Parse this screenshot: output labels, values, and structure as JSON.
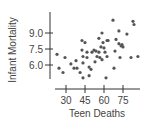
{
  "chart_data": {
    "type": "scatter",
    "title": "",
    "xlabel": "Teen Deaths",
    "ylabel": "Infant Mortality",
    "xticks": [
      30,
      45,
      60,
      75
    ],
    "xtick_labels": [
      "30",
      "45",
      "60",
      "75"
    ],
    "yticks": [
      6.0,
      7.5,
      9.0
    ],
    "ytick_labels": [
      "6.0",
      "7.5",
      "9.0"
    ],
    "xlim": [
      21,
      90
    ],
    "ylim": [
      4.5,
      11.0
    ],
    "grid": false,
    "legend": null,
    "point_color": "#555555",
    "axis_color": "#333333",
    "points": [
      {
        "x": 22.9,
        "y": 7.0
      },
      {
        "x": 24.5,
        "y": 5.7
      },
      {
        "x": 27.6,
        "y": 5.3
      },
      {
        "x": 29.2,
        "y": 6.7
      },
      {
        "x": 33.9,
        "y": 6.1
      },
      {
        "x": 36.3,
        "y": 5.7
      },
      {
        "x": 37.9,
        "y": 6.4
      },
      {
        "x": 38.7,
        "y": 5.7
      },
      {
        "x": 41.1,
        "y": 5.3
      },
      {
        "x": 42.6,
        "y": 8.3
      },
      {
        "x": 42.6,
        "y": 7.4
      },
      {
        "x": 43.4,
        "y": 6.8
      },
      {
        "x": 43.4,
        "y": 6.2
      },
      {
        "x": 43.4,
        "y": 4.8
      },
      {
        "x": 45.0,
        "y": 8.1
      },
      {
        "x": 46.6,
        "y": 7.2
      },
      {
        "x": 46.6,
        "y": 6.7
      },
      {
        "x": 48.2,
        "y": 5.0
      },
      {
        "x": 48.2,
        "y": 5.8
      },
      {
        "x": 49.7,
        "y": 5.6
      },
      {
        "x": 50.5,
        "y": 7.2
      },
      {
        "x": 52.1,
        "y": 7.4
      },
      {
        "x": 52.9,
        "y": 6.3
      },
      {
        "x": 53.7,
        "y": 7.3
      },
      {
        "x": 54.5,
        "y": 6.8
      },
      {
        "x": 56.0,
        "y": 7.2
      },
      {
        "x": 56.0,
        "y": 8.5
      },
      {
        "x": 56.8,
        "y": 6.7
      },
      {
        "x": 57.6,
        "y": 7.7
      },
      {
        "x": 58.4,
        "y": 9.0
      },
      {
        "x": 58.4,
        "y": 6.5
      },
      {
        "x": 59.2,
        "y": 8.1
      },
      {
        "x": 60.0,
        "y": 7.6
      },
      {
        "x": 60.8,
        "y": 7.2
      },
      {
        "x": 61.6,
        "y": 4.8
      },
      {
        "x": 62.4,
        "y": 6.8
      },
      {
        "x": 62.4,
        "y": 8.3
      },
      {
        "x": 63.2,
        "y": 8.3
      },
      {
        "x": 67.1,
        "y": 10.2
      },
      {
        "x": 67.9,
        "y": 5.7
      },
      {
        "x": 68.7,
        "y": 7.3
      },
      {
        "x": 69.5,
        "y": 8.4
      },
      {
        "x": 71.8,
        "y": 9.2
      },
      {
        "x": 71.8,
        "y": 8.0
      },
      {
        "x": 72.6,
        "y": 6.7
      },
      {
        "x": 73.4,
        "y": 7.8
      },
      {
        "x": 74.2,
        "y": 7.9
      },
      {
        "x": 75.0,
        "y": 7.7
      },
      {
        "x": 78.1,
        "y": 8.9
      },
      {
        "x": 81.3,
        "y": 6.7
      },
      {
        "x": 82.9,
        "y": 10.1
      },
      {
        "x": 83.7,
        "y": 9.8
      },
      {
        "x": 86.8,
        "y": 6.8
      }
    ]
  },
  "layout": {
    "x_axis": {
      "line_y": 89,
      "x_start": 55,
      "x_end": 140,
      "px_at_30": 66,
      "px_per_unit": 1.2667,
      "tick_len_up": 4,
      "tick_len_down": 4
    },
    "y_axis": {
      "line_x": 50,
      "y_start": 12,
      "y_end": 79,
      "px_at_9": 33,
      "px_per_unit": 10.667,
      "tick_len_left": 5,
      "tick_len_right": 3
    },
    "point_radius": 1.6
  }
}
